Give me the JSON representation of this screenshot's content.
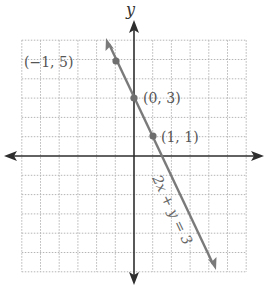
{
  "chart_data": {
    "type": "line",
    "title": "",
    "xlabel": "",
    "ylabel": "y",
    "xlim": [
      -6,
      6
    ],
    "ylim": [
      -6,
      6
    ],
    "grid": true,
    "grid_style": "dotted",
    "ticks_labeled": false,
    "series": [
      {
        "name": "2x + y = 3",
        "equation": "2x + y = 3",
        "x": [
          -1.5,
          4.3
        ],
        "y": [
          6,
          -5.6
        ],
        "arrows": "both",
        "color": "#7a7a7a"
      }
    ],
    "points": [
      {
        "x": -1,
        "y": 5,
        "label": "(−1, 5)"
      },
      {
        "x": 0,
        "y": 3,
        "label": "(0, 3)"
      },
      {
        "x": 1,
        "y": 1,
        "label": "(1, 1)"
      }
    ],
    "annotations": [
      {
        "text": "2x + y = 3",
        "placement": "along line, below right of (1, 1)"
      }
    ],
    "colors": {
      "axis": "#2e2e2e",
      "grid": "#b5b5b5",
      "line": "#7a7a7a",
      "point": "#6e6e6e",
      "text": "#555555"
    }
  },
  "labels": {
    "y_axis": "y",
    "point_a": "(−1, 5)",
    "point_b": "(0, 3)",
    "point_c": "(1, 1)",
    "equation": "2x + y = 3"
  }
}
